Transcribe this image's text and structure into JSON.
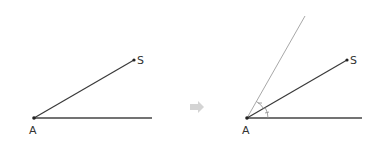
{
  "figure_left": {
    "vertex_label": "A",
    "point_label": "S"
  },
  "figure_right": {
    "vertex_label": "A",
    "point_label": "S"
  },
  "colors": {
    "ray": "#3a3a3a",
    "construction_ray": "#a8a8a8",
    "arc": "#8a8a8a",
    "arrow": "#d4d4d4",
    "label": "#333333"
  }
}
